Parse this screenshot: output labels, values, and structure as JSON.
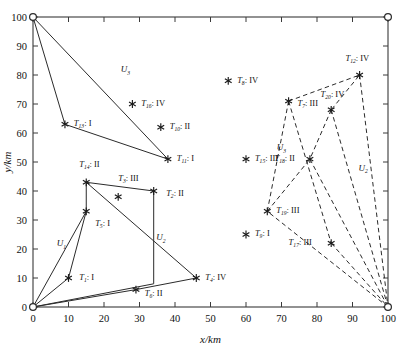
{
  "chart_data": {
    "type": "scatter",
    "title": "",
    "xlabel": "x/km",
    "ylabel": "y/km",
    "xlim": [
      0,
      100
    ],
    "ylim": [
      0,
      100
    ],
    "xticks": [
      0,
      10,
      20,
      30,
      40,
      50,
      60,
      70,
      80,
      90,
      100
    ],
    "yticks": [
      0,
      10,
      20,
      30,
      40,
      50,
      60,
      70,
      80,
      90,
      100
    ],
    "grid": false,
    "legend": "none",
    "depots": [
      {
        "name": "depot-origin",
        "x": 0,
        "y": 0,
        "marker": "open-circle"
      },
      {
        "name": "depot-top-left",
        "x": 0,
        "y": 100,
        "marker": "open-circle"
      },
      {
        "name": "depot-top-right",
        "x": 100,
        "y": 100,
        "marker": "open-circle"
      },
      {
        "name": "depot-bottom-right",
        "x": 100,
        "y": 0,
        "marker": "open-circle"
      }
    ],
    "points": [
      {
        "id": "T1",
        "label": "T",
        "sub": "1",
        "type": "I",
        "x": 10,
        "y": 10,
        "lx": 13,
        "ly": 10.5,
        "anchor": "start"
      },
      {
        "id": "T2",
        "label": "T",
        "sub": "2",
        "type": "II",
        "x": 34,
        "y": 40,
        "lx": 37.5,
        "ly": 39.5,
        "anchor": "start"
      },
      {
        "id": "T3",
        "label": "T",
        "sub": "3",
        "type": "III",
        "x": 24,
        "y": 38,
        "lx": 24,
        "ly": 44.5,
        "anchor": "start"
      },
      {
        "id": "T4",
        "label": "T",
        "sub": "4",
        "type": "IV",
        "x": 46,
        "y": 10,
        "lx": 48.5,
        "ly": 10.5,
        "anchor": "start"
      },
      {
        "id": "T5",
        "label": "T",
        "sub": "5",
        "type": "I",
        "x": 15,
        "y": 33,
        "lx": 17.5,
        "ly": 29,
        "anchor": "start"
      },
      {
        "id": "T6",
        "label": "T",
        "sub": "6",
        "type": "II",
        "x": 29,
        "y": 6,
        "lx": 31.5,
        "ly": 4.8,
        "anchor": "start"
      },
      {
        "id": "T7",
        "label": "T",
        "sub": "7",
        "type": "III",
        "x": 72,
        "y": 71,
        "lx": 74.5,
        "ly": 70.5,
        "anchor": "start"
      },
      {
        "id": "T8",
        "label": "T",
        "sub": "8",
        "type": "IV",
        "x": 55,
        "y": 78,
        "lx": 57.5,
        "ly": 78.5,
        "anchor": "start"
      },
      {
        "id": "T9",
        "label": "T",
        "sub": "9",
        "type": "I",
        "x": 60,
        "y": 25,
        "lx": 62.5,
        "ly": 25.5,
        "anchor": "start"
      },
      {
        "id": "T10",
        "label": "T",
        "sub": "10",
        "type": "II",
        "x": 36,
        "y": 62,
        "lx": 38.5,
        "ly": 62.5,
        "anchor": "start"
      },
      {
        "id": "T11",
        "label": "T",
        "sub": "11",
        "type": "I",
        "x": 38,
        "y": 51,
        "lx": 40.5,
        "ly": 51.5,
        "anchor": "start"
      },
      {
        "id": "T12",
        "label": "T",
        "sub": "12",
        "type": "IV",
        "x": 92,
        "y": 80,
        "lx": 88,
        "ly": 86,
        "anchor": "start"
      },
      {
        "id": "T13",
        "label": "T",
        "sub": "13",
        "type": "I",
        "x": 9,
        "y": 63,
        "lx": 11.5,
        "ly": 63.5,
        "anchor": "start"
      },
      {
        "id": "T14",
        "label": "T",
        "sub": "14",
        "type": "II",
        "x": 15,
        "y": 43,
        "lx": 13,
        "ly": 49.5,
        "anchor": "start"
      },
      {
        "id": "T15",
        "label": "T",
        "sub": "15",
        "type": "III",
        "x": 60,
        "y": 51,
        "lx": 62.5,
        "ly": 51.5,
        "anchor": "start"
      },
      {
        "id": "T16",
        "label": "T",
        "sub": "16",
        "type": "IV",
        "x": 28,
        "y": 70,
        "lx": 30.5,
        "ly": 70.5,
        "anchor": "start"
      },
      {
        "id": "T17",
        "label": "T",
        "sub": "17",
        "type": "III",
        "x": 84,
        "y": 22,
        "lx": 72,
        "ly": 22.5,
        "anchor": "start"
      },
      {
        "id": "T18",
        "label": "T",
        "sub": "18",
        "type": "II",
        "x": 78,
        "y": 51,
        "lx": 68,
        "ly": 51.5,
        "anchor": "start"
      },
      {
        "id": "T19",
        "label": "T",
        "sub": "19",
        "type": "III",
        "x": 66,
        "y": 33,
        "lx": 68.5,
        "ly": 33.5,
        "anchor": "start"
      },
      {
        "id": "T20",
        "label": "T",
        "sub": "20",
        "type": "IV",
        "x": 84,
        "y": 68,
        "lx": 81,
        "ly": 73.5,
        "anchor": "start"
      }
    ],
    "route_labels": [
      {
        "id": "U1",
        "label": "U",
        "sub": "1",
        "x": 8,
        "y": 21
      },
      {
        "id": "U2",
        "label": "U",
        "sub": "2",
        "x": 36,
        "y": 23
      },
      {
        "id": "U3",
        "label": "U",
        "sub": "3",
        "x": 26,
        "y": 81
      },
      {
        "id": "U2b",
        "label": "U",
        "sub": "2",
        "x": 93,
        "y": 47
      },
      {
        "id": "U3b",
        "label": "U",
        "sub": "3",
        "x": 70,
        "y": 54
      }
    ],
    "solid_routes": [
      {
        "name": "solid-route-upper",
        "points": [
          [
            0,
            100
          ],
          [
            9,
            63
          ],
          [
            38,
            51
          ],
          [
            0,
            100
          ]
        ]
      },
      {
        "name": "solid-route-mid",
        "points": [
          [
            0,
            0
          ],
          [
            15,
            33
          ],
          [
            15,
            43
          ],
          [
            34,
            40
          ],
          [
            34,
            8
          ],
          [
            0,
            0
          ]
        ]
      },
      {
        "name": "solid-route-lower",
        "points": [
          [
            0,
            0
          ],
          [
            10,
            10
          ],
          [
            15,
            33
          ]
        ]
      },
      {
        "name": "solid-route-diag",
        "points": [
          [
            15,
            43
          ],
          [
            46,
            10
          ]
        ]
      },
      {
        "name": "solid-route-base",
        "points": [
          [
            0,
            0
          ],
          [
            29,
            6
          ],
          [
            46,
            10
          ]
        ]
      }
    ],
    "dashed_routes": [
      {
        "name": "dashed-route-top",
        "points": [
          [
            72,
            71
          ],
          [
            92,
            80
          ],
          [
            84,
            68
          ]
        ]
      },
      {
        "name": "dashed-route-left",
        "points": [
          [
            72,
            71
          ],
          [
            66,
            33
          ],
          [
            100,
            0
          ]
        ]
      },
      {
        "name": "dashed-route-right",
        "points": [
          [
            92,
            80
          ],
          [
            100,
            0
          ]
        ]
      },
      {
        "name": "dashed-route-fan1",
        "points": [
          [
            84,
            68
          ],
          [
            100,
            0
          ]
        ]
      },
      {
        "name": "dashed-route-fan2",
        "points": [
          [
            78,
            51
          ],
          [
            100,
            0
          ]
        ]
      },
      {
        "name": "dashed-route-fan3",
        "points": [
          [
            84,
            22
          ],
          [
            100,
            0
          ]
        ]
      },
      {
        "name": "dashed-route-cross",
        "points": [
          [
            84,
            68
          ],
          [
            78,
            51
          ]
        ]
      },
      {
        "name": "dashed-route-x1",
        "points": [
          [
            66,
            33
          ],
          [
            78,
            51
          ]
        ]
      },
      {
        "name": "dashed-route-x2",
        "points": [
          [
            72,
            71
          ],
          [
            84,
            22
          ]
        ]
      }
    ]
  }
}
